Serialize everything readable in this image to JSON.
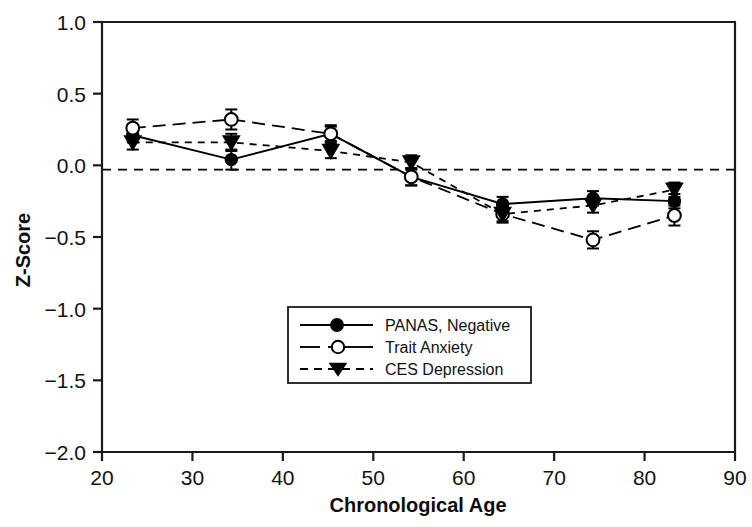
{
  "chart_data": {
    "type": "line",
    "title": "",
    "xlabel": "Chronological Age",
    "ylabel": "Z-Score",
    "xlim": [
      20,
      90
    ],
    "ylim": [
      -2.0,
      1.0
    ],
    "xticks": [
      20,
      30,
      40,
      50,
      60,
      70,
      80,
      90
    ],
    "xtick_labels": [
      "20",
      "30",
      "40",
      "50",
      "60",
      "70",
      "80",
      "90"
    ],
    "yticks": [
      1.0,
      0.5,
      0.0,
      -0.5,
      -1.0,
      -1.5,
      -2.0
    ],
    "ytick_labels": [
      "1.0",
      "0.5",
      "0.0",
      "−0.5",
      "−1.0",
      "−1.5",
      "−2.0"
    ],
    "grid": false,
    "legend_position": "center",
    "reference_line": {
      "y": -0.03,
      "style": "dashed",
      "label": "zero reference"
    },
    "x": [
      23.4,
      34.3,
      45.3,
      54.2,
      64.3,
      74.3,
      83.3
    ],
    "series": [
      {
        "name": "PANAS, Negative",
        "marker": "filled-circle",
        "line_style": "solid",
        "values": [
          0.21,
          0.04,
          0.22,
          -0.08,
          -0.27,
          -0.23,
          -0.25
        ],
        "errors": [
          0.05,
          0.07,
          0.05,
          0.06,
          0.05,
          0.05,
          0.05
        ]
      },
      {
        "name": "Trait Anxiety",
        "marker": "open-circle",
        "line_style": "long-dash",
        "values": [
          0.26,
          0.32,
          0.22,
          -0.08,
          -0.34,
          -0.52,
          -0.35
        ],
        "errors": [
          0.06,
          0.07,
          0.06,
          0.06,
          0.06,
          0.06,
          0.07
        ]
      },
      {
        "name": "CES Depression",
        "marker": "filled-triangle-down",
        "line_style": "dashed",
        "values": [
          0.16,
          0.16,
          0.1,
          0.02,
          -0.34,
          -0.28,
          -0.17
        ],
        "errors": [
          0.05,
          0.06,
          0.05,
          0.05,
          0.05,
          0.05,
          0.05
        ]
      }
    ]
  },
  "axes": {
    "y_title": "Z-Score",
    "x_title": "Chronological Age"
  },
  "legend": {
    "entries": [
      {
        "label": "PANAS, Negative"
      },
      {
        "label": "Trait Anxiety"
      },
      {
        "label": "CES Depression"
      }
    ]
  },
  "colors": {
    "ink": "#000000",
    "background": "#ffffff"
  }
}
